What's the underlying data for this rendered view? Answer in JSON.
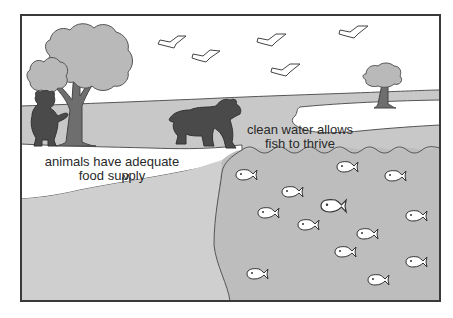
{
  "illustration": {
    "captions": {
      "land_line1": "animals have adequate",
      "land_line2": "food supply",
      "water_line1": "clean water allows",
      "water_line2": "fish to thrive"
    },
    "colors": {
      "border": "#3a3a3a",
      "sky": "#ffffff",
      "far_shore": "#c8c8c8",
      "foreground_land": "#cfcfcf",
      "water": "#bdbdbd",
      "tree_canopy": "#b9b9b9",
      "tree_trunk": "#6e6e6e",
      "bear": "#4a4a4a",
      "fish": "#ffffff",
      "text": "#2a2a2a"
    },
    "elements": {
      "birds": 5,
      "fish": 13,
      "bears": 2,
      "trees": 2
    }
  }
}
